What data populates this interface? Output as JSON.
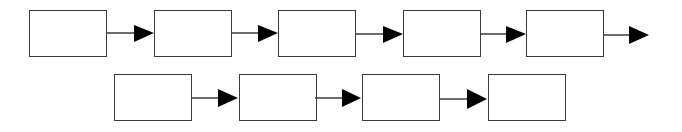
{
  "diagram": {
    "type": "flowchart",
    "rows": [
      {
        "boxes": [
          {
            "x": 29,
            "y": 10,
            "label": ""
          },
          {
            "x": 154,
            "y": 10,
            "label": ""
          },
          {
            "x": 278,
            "y": 10,
            "label": ""
          },
          {
            "x": 403,
            "y": 10,
            "label": ""
          },
          {
            "x": 526,
            "y": 10,
            "label": ""
          }
        ],
        "trailing_arrow": true,
        "arrow_y": 33
      },
      {
        "boxes": [
          {
            "x": 114,
            "y": 74,
            "label": ""
          },
          {
            "x": 239,
            "y": 74,
            "label": ""
          },
          {
            "x": 362,
            "y": 74,
            "label": ""
          },
          {
            "x": 488,
            "y": 74,
            "label": ""
          }
        ],
        "trailing_arrow": false,
        "arrow_y": 98
      }
    ],
    "colors": {
      "stroke": "#3a3a3a",
      "arrowhead": "#000000",
      "fill": "#ffffff"
    }
  }
}
